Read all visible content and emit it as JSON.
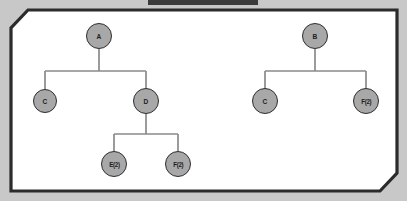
{
  "window": {
    "title_strip_text": "",
    "background_color": "#c8c8c8",
    "panel_background": "#ffffff",
    "panel_border_color": "#2b2b2b"
  },
  "theme": {
    "node_fill": "#a8a8a8",
    "node_stroke": "#2e2e2e",
    "edge_color": "#8a8a8a",
    "label_color": "#1c1c1c"
  },
  "diagram": {
    "type": "tree-diagram",
    "trees": [
      {
        "id": "left-tree",
        "root": "A",
        "nodes": [
          {
            "id": "A",
            "label": "A",
            "x": 99,
            "y": 36,
            "r": 13
          },
          {
            "id": "C1",
            "label": "C",
            "x": 45,
            "y": 101,
            "r": 12
          },
          {
            "id": "D",
            "label": "D",
            "x": 146,
            "y": 101,
            "r": 13
          },
          {
            "id": "E2",
            "label": "E(2)",
            "x": 114,
            "y": 164,
            "r": 13
          },
          {
            "id": "F2",
            "label": "F(2)",
            "x": 178,
            "y": 164,
            "r": 13
          }
        ],
        "edges": [
          {
            "from": "A",
            "to": "C1"
          },
          {
            "from": "A",
            "to": "D"
          },
          {
            "from": "D",
            "to": "E2"
          },
          {
            "from": "D",
            "to": "F2"
          }
        ]
      },
      {
        "id": "right-tree",
        "root": "B",
        "nodes": [
          {
            "id": "B",
            "label": "B",
            "x": 315,
            "y": 36,
            "r": 13
          },
          {
            "id": "C2",
            "label": "C",
            "x": 265,
            "y": 101,
            "r": 13
          },
          {
            "id": "F2b",
            "label": "F(2)",
            "x": 366,
            "y": 101,
            "r": 13
          }
        ],
        "edges": [
          {
            "from": "B",
            "to": "C2"
          },
          {
            "from": "B",
            "to": "F2b"
          }
        ]
      }
    ]
  }
}
